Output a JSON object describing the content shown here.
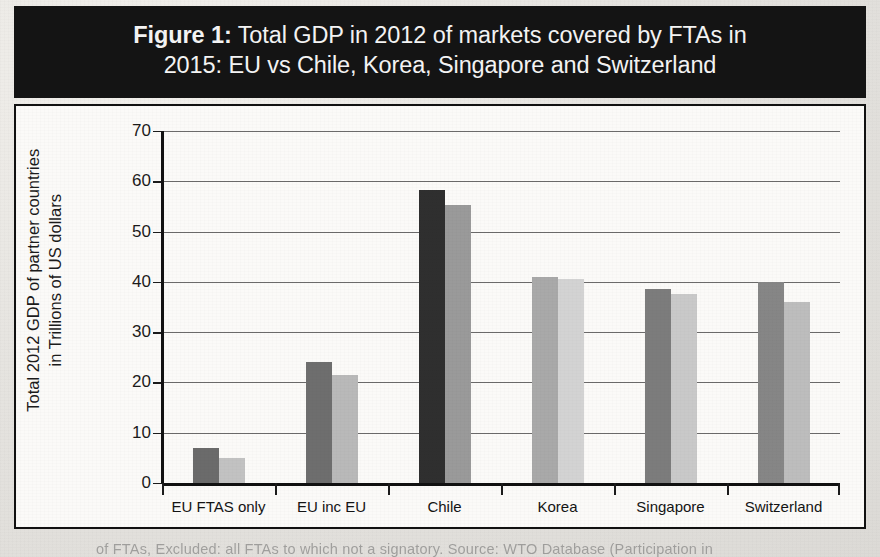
{
  "figure": {
    "label": "Figure 1:",
    "title_line1": "Total GDP in 2012 of markets covered by FTAs in",
    "title_line2": "2015: EU vs Chile, Korea, Singapore and Switzerland",
    "title_bar_color": "#141414",
    "title_text_color": "#f4f4f4"
  },
  "caption_partial": "of FTAs, Excluded: all FTAs to which not a signatory.   Source: WTO Database (Participation in",
  "chart_data": {
    "type": "bar",
    "title": "Figure 1: Total GDP in 2012 of markets covered by FTAs in 2015: EU vs Chile, Korea, Singapore and Switzerland",
    "xlabel": "",
    "ylabel": "Total 2012 GDP of partner countries in Trillions of US dollars",
    "ylabel_line1": "Total 2012 GDP of partner countries",
    "ylabel_line2": "in Trillions of US dollars",
    "categories": [
      "EU FTAS only",
      "EU inc EU",
      "Chile",
      "Korea",
      "Singapore",
      "Switzerland"
    ],
    "series": [
      {
        "name": "series-1",
        "values": [
          7.0,
          24.0,
          58.3,
          41.0,
          38.5,
          40.0
        ],
        "colors": [
          "#6b6b6b",
          "#6e6e6e",
          "#2f2f2f",
          "#a9a9a9",
          "#7c7c7c",
          "#868686"
        ]
      },
      {
        "name": "series-2",
        "values": [
          4.9,
          21.5,
          55.3,
          40.5,
          37.5,
          36.0
        ],
        "colors": [
          "#c2c2c2",
          "#b9b9b9",
          "#9a9a9a",
          "#d3d3d3",
          "#c9c9c9",
          "#bdbdbd"
        ]
      }
    ],
    "ylim": [
      0,
      70
    ],
    "yticks": [
      0,
      10,
      20,
      30,
      40,
      50,
      60,
      70
    ],
    "ytick_labels": [
      "0",
      "10",
      "20",
      "30",
      "40",
      "50",
      "60",
      "70"
    ],
    "grid": true,
    "legend": "none",
    "background": "#fbfaf8"
  }
}
